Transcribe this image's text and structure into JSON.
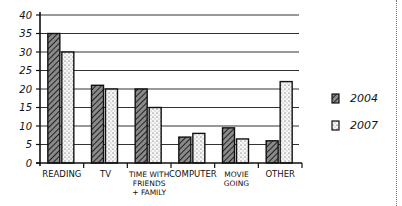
{
  "chart_data": {
    "type": "bar",
    "title": "",
    "xlabel": "",
    "ylabel": "",
    "ylim": [
      0,
      40
    ],
    "yticks": [
      0,
      5,
      10,
      15,
      20,
      25,
      30,
      35,
      40
    ],
    "grid": true,
    "legend_position": "right",
    "categories": [
      "READING",
      "TV",
      "TIME WITH FRIENDS + FAMILY",
      "COMPUTER",
      "MOVIE GOING",
      "OTHER"
    ],
    "category_label_lines": [
      [
        "READING"
      ],
      [
        "TV"
      ],
      [
        "TIME WITH",
        "FRIENDS",
        "+ FAMILY"
      ],
      [
        "COMPUTER"
      ],
      [
        "MOVIE",
        "GOING"
      ],
      [
        "OTHER"
      ]
    ],
    "series": [
      {
        "name": "2004",
        "pattern": "hatched",
        "values": [
          35,
          21,
          20,
          7,
          9.5,
          6
        ]
      },
      {
        "name": "2007",
        "pattern": "dotted",
        "values": [
          30,
          20,
          15,
          8,
          6.5,
          22
        ]
      }
    ]
  },
  "legend": {
    "items": [
      {
        "label": "2004",
        "pattern": "hatched"
      },
      {
        "label": "2007",
        "pattern": "dotted"
      }
    ]
  },
  "colors": {
    "ink": "#111111",
    "hatch_fill": "#6a6a6a",
    "dot_fill": "#f4f4f4"
  }
}
